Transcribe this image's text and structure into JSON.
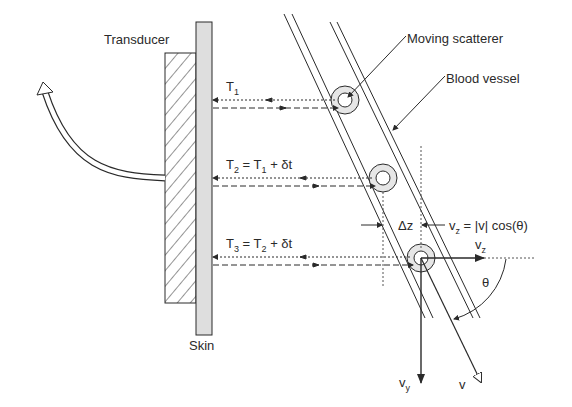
{
  "diagram": {
    "labels": {
      "transducer": "Transducer",
      "skin": "Skin",
      "moving_scatterer": "Moving scatterer",
      "blood_vessel": "Blood vessel"
    },
    "echo_times": [
      {
        "label": "T",
        "sub": "1",
        "rest": ""
      },
      {
        "label": "T",
        "sub": "2",
        "rest": " = T",
        "rest_sub": "1",
        "tail": " + δt"
      },
      {
        "label": "T",
        "sub": "3",
        "rest": " = T",
        "rest_sub": "2",
        "tail": " + δt"
      }
    ],
    "delta_z": "Δz",
    "velocity_eq": {
      "lhs": "v",
      "lhs_sub": "z",
      "rhs": " = |v| cos(θ)"
    },
    "vectors": {
      "vz": {
        "label": "v",
        "sub": "z"
      },
      "vy": {
        "label": "v",
        "sub": "y"
      },
      "v": {
        "label": "v"
      }
    },
    "angle": "θ",
    "colors": {
      "line": "#2a2a2a",
      "skin_fill": "#dedede",
      "scatterer_fill": "#e6e6e6",
      "background": "#ffffff"
    }
  }
}
